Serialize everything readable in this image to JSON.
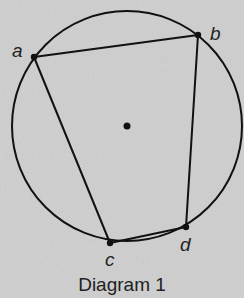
{
  "diagram": {
    "caption": "Diagram 1",
    "circle": {
      "cx": 127,
      "cy": 126,
      "r": 115
    },
    "center_point": {
      "x": 127,
      "y": 126
    },
    "points": [
      {
        "id": "a",
        "label": "a",
        "x": 34,
        "y": 57
      },
      {
        "id": "b",
        "label": "b",
        "x": 198,
        "y": 35
      },
      {
        "id": "c",
        "label": "c",
        "x": 110,
        "y": 243
      },
      {
        "id": "d",
        "label": "d",
        "x": 186,
        "y": 227
      }
    ],
    "segments": [
      [
        "a",
        "b"
      ],
      [
        "b",
        "d"
      ],
      [
        "d",
        "c"
      ],
      [
        "c",
        "a"
      ]
    ],
    "colors": {
      "background": "#cfcfcf",
      "stroke": "#111111"
    }
  }
}
